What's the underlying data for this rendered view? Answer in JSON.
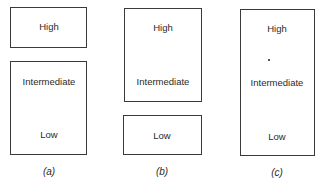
{
  "diagrams": [
    {
      "caption": "(a)",
      "boxes": [
        {
          "labels": [
            "High"
          ]
        },
        {
          "labels": [
            "Intermediate",
            "Low"
          ]
        }
      ]
    },
    {
      "caption": "(b)",
      "boxes": [
        {
          "labels": [
            "High",
            "Intermediate"
          ]
        },
        {
          "labels": [
            "Low"
          ]
        }
      ]
    },
    {
      "caption": "(c)",
      "boxes": [
        {
          "labels": [
            "High",
            "Intermediate",
            "Low"
          ]
        }
      ]
    }
  ]
}
